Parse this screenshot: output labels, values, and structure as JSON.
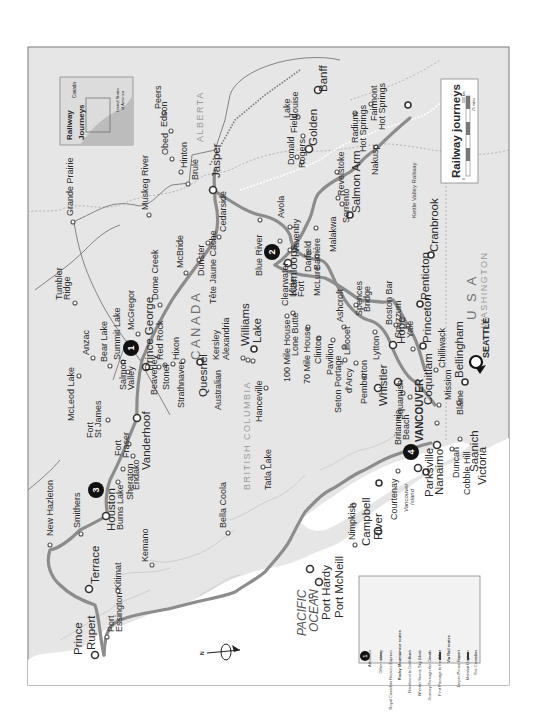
{
  "map": {
    "title": "Railway journeys",
    "inset": {
      "title_line1": "Railway",
      "title_line2": "Journeys",
      "label_canada": "Canada",
      "label_usa_line1": "United States",
      "label_usa_line2": "of America"
    },
    "scale": {
      "km_label": "100 km",
      "miles_label": "75 miles",
      "zero": "0"
    },
    "regions": {
      "alberta": "ALBERTA",
      "british_columbia": "BRITISH COLUMBIA",
      "canada": "CANADA",
      "usa": "U S A",
      "washington": "WASHINGTON",
      "pacific_line1": "PACIFIC",
      "pacific_line2": "OCEAN",
      "vancouver_island_line1": "Vancouver",
      "vancouver_island_line2": "Island",
      "kettle_valley": "Kettle Valley Railway"
    },
    "compass": {
      "north": "N"
    },
    "route_badges": [
      "1",
      "2",
      "3",
      "4"
    ],
    "major_cities": {
      "prince_rupert_1": "Prince",
      "prince_rupert_2": "Rupert",
      "terrace": "Terrace",
      "houston": "Houston",
      "vanderhoof": "Vanderhoof",
      "prince_george": "Prince George",
      "quesnel": "Quesnel",
      "williams_lake_1": "Williams",
      "williams_lake_2": "Lake",
      "kamloops": "Kamloops",
      "salmon_arm": "Salmon Arm",
      "golden": "Golden",
      "banff": "Banff",
      "jasper": "Jasper",
      "whistler": "Whistler",
      "vancouver": "VANCOUVER",
      "coquitlam": "Coquitlam",
      "hope": "Hope",
      "princeton": "Princeton",
      "penticton": "Penticton",
      "cranbrook": "Cranbrook",
      "nanaimo": "Nanaimo",
      "parksville": "Parksville",
      "victoria": "Victoria",
      "saanich": "Saanich",
      "campbell_river_1": "Campbell",
      "campbell_river_2": "River",
      "port_hardy": "Port Hardy",
      "port_mcneill": "Port McNeill",
      "seattle": "SEATTLE",
      "bellingham": "Bellingham"
    },
    "towns": {
      "grande_prairie": "Grande Prairie",
      "muskeg_river": "Muskeg River",
      "peers": "Peers",
      "edson": "Edson",
      "obed": "Obed",
      "hinton": "Hinton",
      "brule": "Brulé",
      "cedarside": "Cedarside",
      "tumbler_ridge_1": "Tumbler",
      "tumbler_ridge_2": "Ridge",
      "anzac": "Anzac",
      "bear_lake": "Bear Lake",
      "summit_lake": "Summit Lake",
      "mcgregor": "McGregor",
      "dome_creek": "Dome Creek",
      "mcbride": "McBride",
      "dunster": "Dunster",
      "tete_jaune": "Tête Jaune Cache",
      "blue_river": "Blue River",
      "avola": "Avola",
      "vavenby": "Vavenby",
      "clearwater": "Clearwater",
      "little_fort_1": "Little",
      "little_fort_2": "Fort",
      "darfield": "Darfield",
      "barriere": "Barrière",
      "mclure": "McLure",
      "malakwa": "Malakwa",
      "sorrento": "Sorrento",
      "revelstoke": "Revelstoke",
      "rogers": "Rogers",
      "donald": "Donald",
      "field": "Field",
      "lake_louise_1": "Lake",
      "lake_louise_2": "Louise",
      "radium_1": "Radium",
      "radium_2": "Hot Springs",
      "fairmont_1": "Fairmont",
      "fairmont_2": "Hot Springs",
      "nakusp": "Nakusp",
      "mcleod_lake": "McLeod Lake",
      "fort_st_james_1": "Fort",
      "fort_st_james_2": "St James",
      "salmon_valley_1": "Salmon",
      "salmon_valley_2": "Valley",
      "fort_fraser_1": "Fort",
      "fort_fraser_2": "Fraser",
      "beaverley": "Beaverley",
      "red_rock": "Red Rock",
      "stoner": "Stoner",
      "hixon": "Hixon",
      "strathnaver": "Strathnaver",
      "kersley": "Kersley",
      "australian": "Australian",
      "alexandria": "Alexandria",
      "endako": "Endako",
      "sheraton": "Sheraton",
      "burns_lake": "Burns Lake",
      "new_hazleton": "New Hazleton",
      "smithers": "Smithers",
      "kitimat": "Kitimat",
      "kemano": "Kemano",
      "port_essington_1": "Port",
      "port_essington_2": "Essington",
      "bella_coola": "Bella Coola",
      "tatla_lake": "Tatla Lake",
      "hanceville": "Hanceville",
      "mile100": "100 Mile House",
      "lone_butte": "Lone Butte",
      "mile70": "70 Mile House",
      "clinton": "Clinton",
      "pavilion": "Pavilion",
      "lillooet": "Lillooet",
      "seton_portage": "Seton Portage",
      "darcy": "d'Arcy",
      "pemberton": "Pemberton",
      "ashcroft": "Ashcroft",
      "spences_bridge_1": "Spences",
      "spences_bridge_2": "Bridge",
      "lytton": "Lytton",
      "boston_bar": "Boston Bar",
      "spuzzum": "Spuzzum",
      "yale": "Yale",
      "chilliwack": "Chilliwack",
      "mission": "Mission",
      "squamish": "Squamish",
      "britannia_1": "Britannia",
      "britannia_2": "Beach",
      "blaine": "Blaine",
      "duncan": "Duncan",
      "cobble_hill": "Cobble Hill",
      "courtenay": "Courtenay",
      "nimpkish": "Nimpkish"
    },
    "legend": [
      {
        "symbol": "badge",
        "label": "Attraction"
      },
      {
        "symbol": "line-thin",
        "label": "Other railway"
      },
      {
        "symbol": "line-dotted",
        "label": "Royal Canadian Rockies Express"
      },
      {
        "symbol": "heading",
        "label": "Rocky Mountaineer routes"
      },
      {
        "symbol": "line",
        "label": "Rainforest to Gold Rush"
      },
      {
        "symbol": "line",
        "label": "Whistler Sea to Sky Climb"
      },
      {
        "symbol": "line",
        "label": "Journey Through the Clouds"
      },
      {
        "symbol": "line-bold",
        "label": "First Passage to the West"
      },
      {
        "symbol": "heading",
        "label": "Via Rail routes"
      },
      {
        "symbol": "line",
        "label": "Jasper-Prince Rupert"
      },
      {
        "symbol": "line-bold",
        "label": "Malahat Dayliner"
      },
      {
        "symbol": "line",
        "label": "The Canadian"
      }
    ],
    "colors": {
      "land": "#e4e4e4",
      "water": "#ffffff",
      "route": "#8c8c8c",
      "frame": "#7a7a7a",
      "badge": "#111111"
    }
  }
}
